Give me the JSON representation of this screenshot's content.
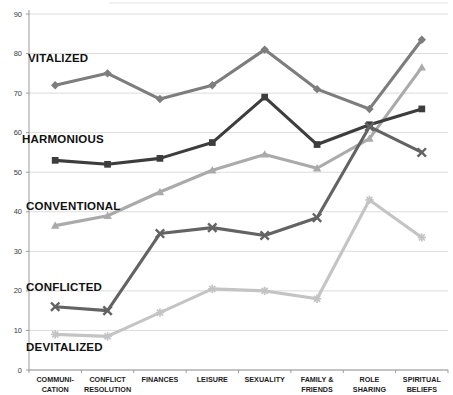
{
  "chart_data": {
    "type": "line",
    "title": "",
    "xlabel": "",
    "ylabel": "",
    "ylim": [
      0,
      90
    ],
    "ytick_values": [
      0,
      10,
      20,
      30,
      40,
      50,
      60,
      70,
      80,
      90
    ],
    "grid": true,
    "legend_position": "inline-labels",
    "categories": [
      "COMMUNI-\nCATION",
      "CONFLICT\nRESOLUTION",
      "FINANCES",
      "LEISURE",
      "SEXUALITY",
      "FAMILY &\nFRIENDS",
      "ROLE\nSHARING",
      "SPIRITUAL\nBELIEFS"
    ],
    "series": [
      {
        "name": "VITALIZED",
        "color": "#7d7d7d",
        "marker": "diamond",
        "values": [
          72,
          75,
          68.5,
          72,
          81,
          71,
          66,
          83.5
        ]
      },
      {
        "name": "HARMONIOUS",
        "color": "#3d3d3d",
        "marker": "square",
        "values": [
          53,
          52,
          53.5,
          57.5,
          69,
          57,
          62,
          66
        ]
      },
      {
        "name": "CONVENTIONAL",
        "color": "#aaaaaa",
        "marker": "triangle",
        "values": [
          36.5,
          39,
          45,
          50.5,
          54.5,
          51,
          58.5,
          76.5
        ]
      },
      {
        "name": "CONFLICTED",
        "color": "#636363",
        "marker": "cross",
        "values": [
          16,
          15,
          34.5,
          36,
          34,
          38.5,
          61.5,
          55
        ]
      },
      {
        "name": "DEVITALIZED",
        "color": "#c4c4c4",
        "marker": "asterisk",
        "values": [
          9,
          8.5,
          14.5,
          20.5,
          20,
          18,
          43,
          33.5
        ]
      }
    ],
    "inline_labels": [
      {
        "text": "VITALIZED",
        "x": 28,
        "y": 52
      },
      {
        "text": "HARMONIOUS",
        "x": 22,
        "y": 133
      },
      {
        "text": "CONVENTIONAL",
        "x": 26,
        "y": 200
      },
      {
        "text": "CONFLICTED",
        "x": 26,
        "y": 281
      },
      {
        "text": "DEVITALIZED",
        "x": 26,
        "y": 341
      }
    ]
  }
}
